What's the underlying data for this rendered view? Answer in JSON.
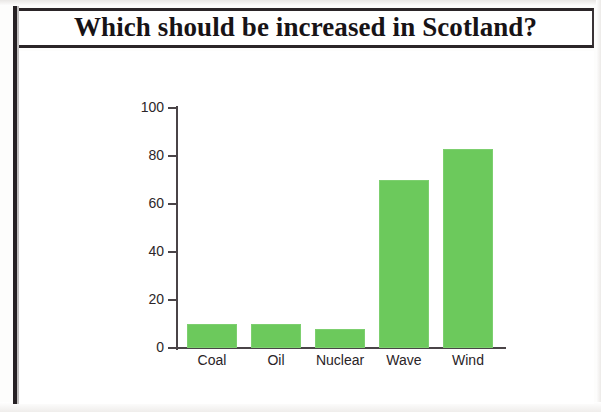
{
  "title": "Which should be increased in Scotland?",
  "chart_data": {
    "type": "bar",
    "title": "Which should be increased in Scotland?",
    "categories": [
      "Coal",
      "Oil",
      "Nuclear",
      "Wave",
      "Wind"
    ],
    "values": [
      10,
      10,
      8,
      70,
      83
    ],
    "xlabel": "",
    "ylabel": "",
    "ylim": [
      0,
      100
    ],
    "ytick_labels": [
      "100",
      "80",
      "60",
      "40",
      "20",
      "0"
    ],
    "ytick_values": [
      100,
      80,
      60,
      40,
      20,
      0
    ],
    "grid": false,
    "legend": false,
    "bar_color": "#6cc95c",
    "axis_color": "#4a4447",
    "background": "#ffffff"
  }
}
